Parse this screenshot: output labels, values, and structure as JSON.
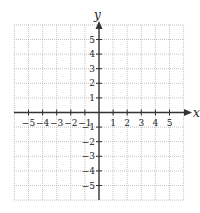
{
  "diagram": {
    "type": "coordinate-plane",
    "x_axis_label": "x",
    "y_axis_label": "y",
    "x_range": [
      -6,
      6
    ],
    "y_range": [
      -6,
      6
    ],
    "x_ticks": [
      "-5",
      "-4",
      "-3",
      "-2",
      "-1",
      "1",
      "2",
      "3",
      "4",
      "5"
    ],
    "y_ticks": [
      "5",
      "4",
      "3",
      "2",
      "1",
      "-1",
      "-2",
      "-3",
      "-4",
      "-5"
    ],
    "grid": "dotted",
    "colors": {
      "axis": "#333333",
      "grid": "#b5b5b5",
      "text": "#222222"
    }
  }
}
